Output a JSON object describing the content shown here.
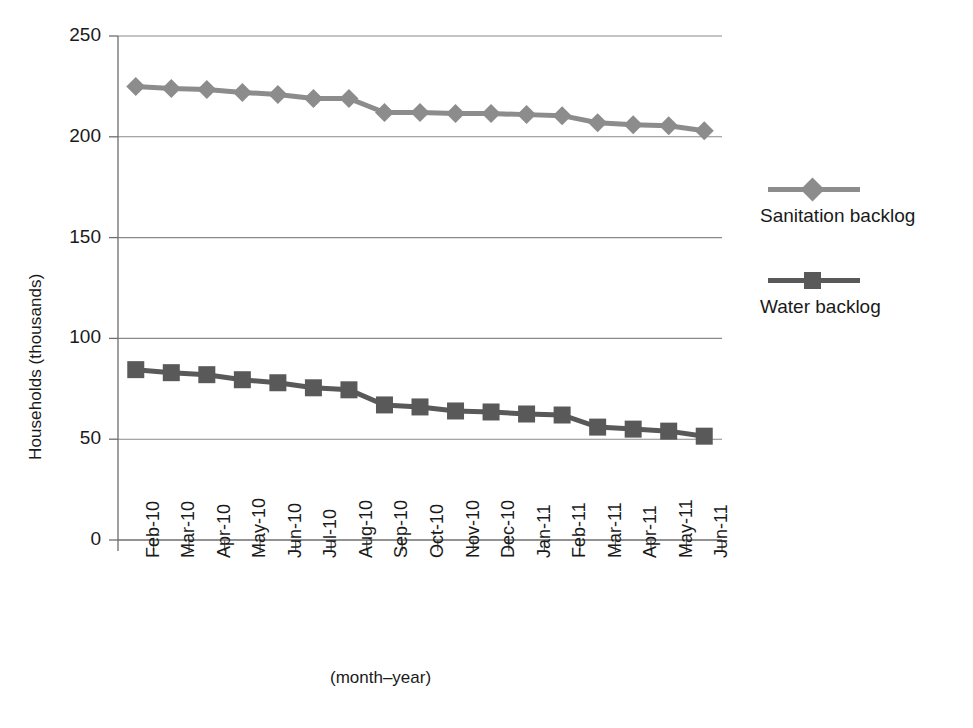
{
  "chart_data": {
    "type": "line",
    "title": "",
    "xlabel": "(month–year)",
    "ylabel": "Households (thousands)",
    "ylim": [
      0,
      250
    ],
    "yticks": [
      0,
      50,
      100,
      150,
      200,
      250
    ],
    "grid": true,
    "legend_position": "right",
    "categories": [
      "Feb-10",
      "Mar-10",
      "Apr-10",
      "May-10",
      "Jun-10",
      "Jul-10",
      "Aug-10",
      "Sep-10",
      "Oct-10",
      "Nov-10",
      "Dec-10",
      "Jan-11",
      "Feb-11",
      "Mar-11",
      "Apr-11",
      "May-11",
      "Jun-11"
    ],
    "series": [
      {
        "name": "Sanitation backlog",
        "color": "#8c8c8c",
        "marker": "diamond",
        "values": [
          225,
          224,
          223.5,
          222,
          221,
          219,
          219,
          212,
          212,
          211.5,
          211.5,
          211,
          210.5,
          207,
          206,
          205.5,
          203
        ]
      },
      {
        "name": "Water backlog",
        "color": "#595959",
        "marker": "square",
        "values": [
          84.5,
          83,
          82,
          79.5,
          78,
          75.5,
          74.5,
          67,
          66,
          64,
          63.5,
          62.5,
          62,
          56,
          55,
          54,
          51.5
        ]
      }
    ]
  },
  "legend": {
    "entries": [
      {
        "label": "Sanitation backlog"
      },
      {
        "label": "Water backlog"
      }
    ]
  },
  "axis_titles": {
    "y": "Households (thousands)",
    "x": "(month–year)"
  },
  "colors": {
    "sanitation": "#8c8c8c",
    "water": "#595959",
    "grid": "#8a8a8a",
    "axis": "#6e6e6e",
    "text": "#1a1a1a",
    "background": "#ffffff"
  }
}
